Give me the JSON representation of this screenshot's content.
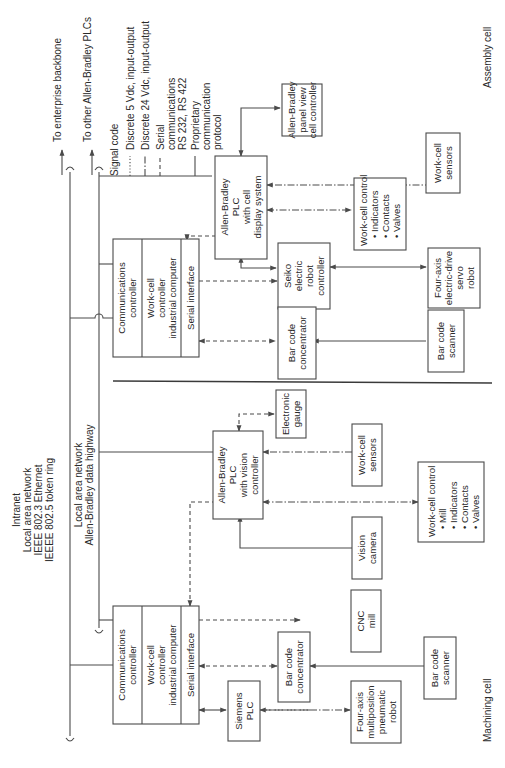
{
  "networks": {
    "intranet": {
      "lines": [
        "Intranet",
        "Local area network",
        "IEEE 802.3 Ethernet",
        "IEEEE 802.5 token ring"
      ],
      "up_label": "To enterprise backbone"
    },
    "highway": {
      "lines": [
        "Local area network",
        "Allen-Bradley data highway"
      ],
      "up_label": "To other Allen-Bradley PLCs"
    }
  },
  "legend": {
    "title": "Signal code",
    "items": [
      {
        "style": "dotted",
        "label": [
          "Discrete 5 Vdc, input-output"
        ]
      },
      {
        "style": "dash-dot",
        "label": [
          "Discrete 24 Vdc, input-output"
        ]
      },
      {
        "style": "dashed",
        "label": [
          "Serial",
          "communications",
          "RS 232, RS 422"
        ]
      },
      {
        "style": "solid",
        "label": [
          "Proprietary",
          "communication",
          "protocol"
        ]
      }
    ]
  },
  "assembly_cell": {
    "label": "Assembly cell",
    "computer": {
      "sections": [
        [
          "Communications",
          "controller"
        ],
        [
          "Work-cell",
          "controller",
          "industrial computer"
        ],
        [
          "Serial interface"
        ]
      ]
    },
    "plc": [
      "Allen-Bradley",
      "PLC",
      "with cell",
      "display system"
    ],
    "panel_view": [
      "Allen-Bradley",
      "panel view",
      "cell controller"
    ],
    "robot_controller": [
      "Seiko",
      "electric",
      "robot",
      "controller"
    ],
    "bar_code_concentrator": [
      "Bar code",
      "concentrator"
    ],
    "work_cell_control": [
      "Work-cell control",
      "• Indicators",
      "• Contacts",
      "• Valves"
    ],
    "work_cell_sensors": [
      "Work-cell",
      "sensors"
    ],
    "servo_robot": [
      "Four-axis",
      "electric-drive",
      "servo",
      "robot"
    ],
    "bar_code_scanner": [
      "Bar code",
      "scanner"
    ]
  },
  "machining_cell": {
    "label": "Machining cell",
    "computer": {
      "sections": [
        [
          "Communications",
          "controller"
        ],
        [
          "Work-cell",
          "controller",
          "industrial computer"
        ],
        [
          "Serial interface"
        ]
      ]
    },
    "plc": [
      "Allen-Bradley",
      "PLC",
      "with vision",
      "controller"
    ],
    "electronic_gauge": [
      "Electronic",
      "gauge"
    ],
    "work_cell_sensors": [
      "Work-cell",
      "sensors"
    ],
    "work_cell_control": [
      "Work-cell control",
      "• Mill",
      "• Indicators",
      "• Contacts",
      "• Valves"
    ],
    "vision_camera": [
      "Vision",
      "camera"
    ],
    "cnc_mill": [
      "CNC",
      "mill"
    ],
    "siemens_plc": [
      "Siemens",
      "PLC"
    ],
    "bar_code_concentrator": [
      "Bar code",
      "concentrator"
    ],
    "bar_code_scanner": [
      "Bar code",
      "scanner"
    ],
    "pneumatic_robot": [
      "Four-axis",
      "multiposition",
      "pneumatic",
      "robot"
    ]
  }
}
